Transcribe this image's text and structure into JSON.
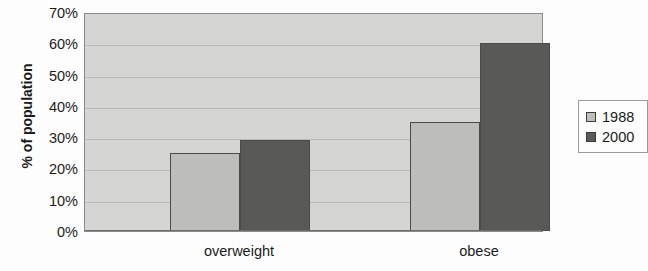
{
  "chart_data": {
    "type": "bar",
    "title": "",
    "xlabel": "",
    "ylabel": "% of population",
    "categories": [
      "overweight",
      "obese"
    ],
    "series": [
      {
        "name": "1988",
        "values": [
          25,
          35
        ],
        "color": "#bdbdbb"
      },
      {
        "name": "2000",
        "values": [
          29,
          60
        ],
        "color": "#595957"
      }
    ],
    "ylim": [
      0,
      70
    ],
    "y_tick_labels": [
      "70%",
      "60%",
      "50%",
      "40%",
      "30%",
      "20%",
      "10%",
      "0%"
    ],
    "y_tick_values": [
      70,
      60,
      50,
      40,
      30,
      20,
      10,
      0
    ],
    "grid": true,
    "grid_axis": "y",
    "legend_position": "right",
    "legend_entries": [
      "1988",
      "2000"
    ],
    "plot_background": "#d5d5d3",
    "axis_color": "#6d6d6d"
  },
  "legend": {
    "entries": [
      {
        "label": "1988"
      },
      {
        "label": "2000"
      }
    ]
  }
}
